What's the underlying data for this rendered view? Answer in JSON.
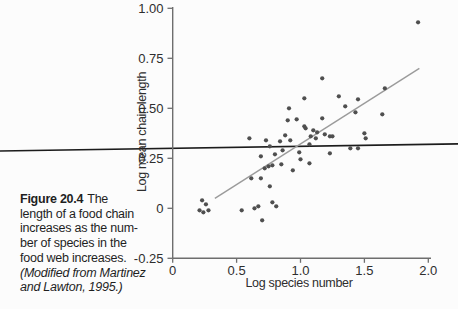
{
  "figure": {
    "caption": {
      "label": "Figure 20.4",
      "lines": [
        "The",
        "length of a food chain",
        "increases as the num-",
        "ber of species in the",
        "food web increases."
      ],
      "source_lines": [
        "(Modified from Martinez",
        "and Lawton, 1995.)"
      ]
    }
  },
  "chart_data": {
    "type": "scatter",
    "title": "",
    "xlabel": "Log species number",
    "ylabel": "Log mean chain length",
    "xlim": [
      0,
      2.0
    ],
    "ylim": [
      -0.25,
      1.0
    ],
    "x_ticks": [
      0,
      0.5,
      1.0,
      1.5,
      2.0
    ],
    "x_tick_labels": [
      "0",
      "0.5",
      "1.0",
      "1.5",
      "2.0"
    ],
    "y_ticks": [
      1.0,
      0.75,
      0.5,
      0.25,
      0,
      -0.25
    ],
    "y_tick_labels": [
      "1.00",
      "0.75",
      "0.50",
      "0.25",
      "0",
      "-0.25"
    ],
    "grid": false,
    "legend": "none",
    "points": [
      [
        0.21,
        -0.01
      ],
      [
        0.23,
        0.04
      ],
      [
        0.24,
        -0.02
      ],
      [
        0.26,
        0.02
      ],
      [
        0.28,
        -0.01
      ],
      [
        0.54,
        -0.01
      ],
      [
        0.64,
        0.0
      ],
      [
        0.67,
        0.01
      ],
      [
        0.7,
        -0.06
      ],
      [
        0.78,
        0.03
      ],
      [
        0.81,
        0.01
      ],
      [
        0.615,
        0.15
      ],
      [
        0.69,
        0.15
      ],
      [
        0.76,
        0.11
      ],
      [
        0.69,
        0.26
      ],
      [
        0.72,
        0.2
      ],
      [
        0.75,
        0.21
      ],
      [
        0.78,
        0.215
      ],
      [
        0.85,
        0.22
      ],
      [
        0.94,
        0.19
      ],
      [
        0.8,
        0.27
      ],
      [
        1.0,
        0.245
      ],
      [
        0.99,
        0.28
      ],
      [
        1.07,
        0.225
      ],
      [
        1.07,
        0.32
      ],
      [
        0.76,
        0.31
      ],
      [
        0.86,
        0.29
      ],
      [
        0.84,
        0.335
      ],
      [
        0.88,
        0.365
      ],
      [
        0.6,
        0.35
      ],
      [
        0.73,
        0.34
      ],
      [
        0.92,
        0.34
      ],
      [
        1.04,
        0.4
      ],
      [
        1.1,
        0.39
      ],
      [
        1.13,
        0.38
      ],
      [
        1.08,
        0.36
      ],
      [
        1.12,
        0.35
      ],
      [
        1.19,
        0.37
      ],
      [
        1.23,
        0.36
      ],
      [
        1.25,
        0.36
      ],
      [
        0.9,
        0.44
      ],
      [
        0.97,
        0.445
      ],
      [
        1.03,
        0.41
      ],
      [
        1.17,
        0.45
      ],
      [
        0.91,
        0.5
      ],
      [
        1.03,
        0.55
      ],
      [
        1.17,
        0.65
      ],
      [
        1.3,
        0.56
      ],
      [
        1.35,
        0.51
      ],
      [
        1.43,
        0.48
      ],
      [
        1.45,
        0.545
      ],
      [
        1.23,
        0.275
      ],
      [
        1.39,
        0.3
      ],
      [
        1.45,
        0.3
      ],
      [
        1.5,
        0.375
      ],
      [
        1.51,
        0.35
      ],
      [
        1.64,
        0.47
      ],
      [
        1.66,
        0.6
      ],
      [
        1.92,
        0.93
      ]
    ],
    "trend_line": {
      "x_start": 0.33,
      "y_start": 0.05,
      "x_end": 1.93,
      "y_end": 0.7
    },
    "horizontal_rule": {
      "spans_full_figure_width": true,
      "y_value_at_x_0": 0.3,
      "y_value_at_x_2": 0.32
    },
    "colors": {
      "point": "#4f4f4f",
      "trend_line": "#9b9b9b",
      "horizontal_rule": "#1c1c1c",
      "axis": "#6e6e6e",
      "tick_text": "#2e2e2e",
      "background": "#fcfcfc"
    }
  }
}
